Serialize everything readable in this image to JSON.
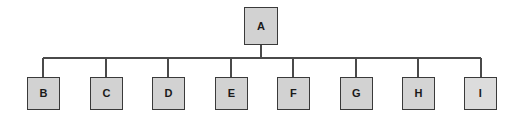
{
  "diagram": {
    "type": "tree",
    "title": "",
    "canvas": {
      "width": 519,
      "height": 119,
      "background": "#ffffff"
    },
    "style": {
      "node_fill": "#d2d2d2",
      "node_fill_light": "#dcdcdc",
      "node_border": "#3a3a3a",
      "edge_color": "#4a4a4a",
      "label_color": "#1a1a1a"
    },
    "root": {
      "id": "A",
      "label": "A",
      "x": 244,
      "y": 7,
      "width": 34,
      "height": 38,
      "fill": "#d2d2d2"
    },
    "bus": {
      "y": 58,
      "x_start": 43,
      "x_end": 481,
      "stem_x": 261,
      "stem_top": 45
    },
    "children": [
      {
        "id": "B",
        "label": "B",
        "x": 27,
        "y": 77,
        "width": 33,
        "height": 33,
        "fill": "#d2d2d2",
        "drop_x": 43
      },
      {
        "id": "C",
        "label": "C",
        "x": 90,
        "y": 77,
        "width": 33,
        "height": 33,
        "fill": "#d2d2d2",
        "drop_x": 106
      },
      {
        "id": "D",
        "label": "D",
        "x": 152,
        "y": 77,
        "width": 33,
        "height": 33,
        "fill": "#d2d2d2",
        "drop_x": 168
      },
      {
        "id": "E",
        "label": "E",
        "x": 215,
        "y": 77,
        "width": 33,
        "height": 33,
        "fill": "#d2d2d2",
        "drop_x": 231
      },
      {
        "id": "F",
        "label": "F",
        "x": 277,
        "y": 77,
        "width": 33,
        "height": 33,
        "fill": "#d2d2d2",
        "drop_x": 293
      },
      {
        "id": "G",
        "label": "G",
        "x": 340,
        "y": 77,
        "width": 33,
        "height": 33,
        "fill": "#d2d2d2",
        "drop_x": 356
      },
      {
        "id": "H",
        "label": "H",
        "x": 402,
        "y": 77,
        "width": 33,
        "height": 33,
        "fill": "#d4d4d4",
        "drop_x": 418
      },
      {
        "id": "I",
        "label": "I",
        "x": 464,
        "y": 77,
        "width": 33,
        "height": 33,
        "fill": "#dcdcdc",
        "drop_x": 481
      }
    ],
    "edges": [
      {
        "from": "A",
        "to": "B"
      },
      {
        "from": "A",
        "to": "C"
      },
      {
        "from": "A",
        "to": "D"
      },
      {
        "from": "A",
        "to": "E"
      },
      {
        "from": "A",
        "to": "F"
      },
      {
        "from": "A",
        "to": "G"
      },
      {
        "from": "A",
        "to": "H"
      },
      {
        "from": "A",
        "to": "I"
      }
    ]
  }
}
